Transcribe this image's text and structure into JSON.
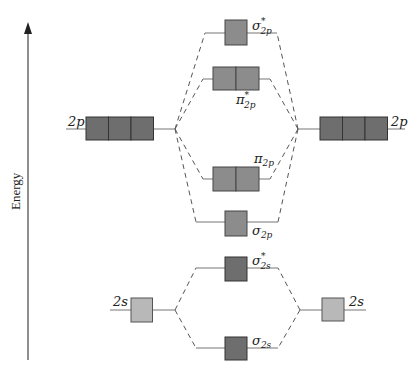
{
  "axis": {
    "label": "Energy"
  },
  "atomic_orbitals": {
    "left_2p": {
      "label": "2p",
      "boxes": 3
    },
    "right_2p": {
      "label": "2p",
      "boxes": 3
    },
    "left_2s": {
      "label": "2s",
      "boxes": 1
    },
    "right_2s": {
      "label": "2s",
      "boxes": 1
    }
  },
  "molecular_orbitals": [
    {
      "id": "sigma_star_2p",
      "symbol": "σ",
      "sup": "*",
      "sub": "2p",
      "boxes": 1
    },
    {
      "id": "pi_star_2p",
      "symbol": "π",
      "sup": "*",
      "sub": "2p",
      "boxes": 2
    },
    {
      "id": "pi_2p",
      "symbol": "π",
      "sup": "",
      "sub": "2p",
      "boxes": 2
    },
    {
      "id": "sigma_2p",
      "symbol": "σ",
      "sup": "",
      "sub": "2p",
      "boxes": 1
    },
    {
      "id": "sigma_star_2s",
      "symbol": "σ",
      "sup": "*",
      "sub": "2s",
      "boxes": 1
    },
    {
      "id": "sigma_2s",
      "symbol": "σ",
      "sup": "",
      "sub": "2s",
      "boxes": 1
    }
  ],
  "colors": {
    "dark_box": "#6e6e6e",
    "mid_box": "#8c8c8c",
    "light_box": "#b8b8b8"
  }
}
